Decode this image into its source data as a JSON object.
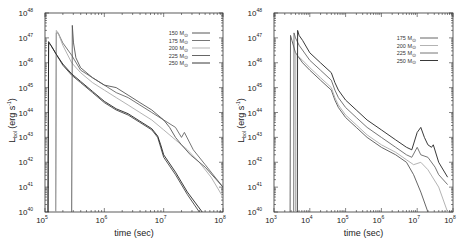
{
  "chart_data": [
    {
      "type": "line",
      "panel": "left",
      "title": "",
      "xlabel": "time (sec)",
      "ylabel": "L_bol (erg s^-1)",
      "ylabel_parts": {
        "main": "L",
        "sub": "bol",
        "rest": " (erg s",
        "sup": "-1",
        "close": ")"
      },
      "xscale": "log",
      "yscale": "log",
      "xlim_exp": [
        5,
        8
      ],
      "ylim_exp": [
        40,
        48
      ],
      "xticks_exp": [
        5,
        6,
        7,
        8
      ],
      "yticks_exp": [
        40,
        41,
        42,
        43,
        44,
        45,
        46,
        47,
        48
      ],
      "tick_base": "10",
      "legend_position": "top-right",
      "series": [
        {
          "name": "150 M⊙",
          "label_num": "150",
          "color": "#444444",
          "log_t": [
            5.05,
            5.06,
            5.1,
            5.2,
            5.3,
            5.45,
            5.6,
            5.8,
            6.0,
            6.2,
            6.4,
            6.6,
            6.8,
            6.9,
            6.95,
            7.0,
            7.2,
            7.4,
            7.6
          ],
          "log_L": [
            40.0,
            46.8,
            46.7,
            46.3,
            45.9,
            45.5,
            45.2,
            44.8,
            44.4,
            44.1,
            43.9,
            43.6,
            43.3,
            43.0,
            42.6,
            42.2,
            41.5,
            40.7,
            40.0
          ]
        },
        {
          "name": "175 M⊙",
          "label_num": "175",
          "color": "#666666",
          "log_t": [
            5.18,
            5.19,
            5.22,
            5.3,
            5.45,
            5.6,
            5.8,
            6.0,
            6.2,
            6.4,
            6.6,
            6.8,
            7.0,
            7.2,
            7.3,
            7.35,
            7.5,
            7.7,
            8.0
          ],
          "log_L": [
            40.0,
            47.2,
            47.2,
            46.8,
            46.3,
            45.7,
            45.4,
            45.1,
            44.8,
            44.6,
            44.3,
            44.0,
            43.7,
            43.4,
            43.0,
            43.2,
            42.5,
            41.9,
            41.0
          ]
        },
        {
          "name": "200 M⊙",
          "label_num": "200",
          "color": "#aaaaaa",
          "log_t": [
            5.18,
            5.19,
            5.22,
            5.3,
            5.45,
            5.6,
            5.8,
            6.0,
            6.2,
            6.4,
            6.6,
            6.8,
            7.0,
            7.2,
            7.4,
            7.6,
            7.8,
            8.0
          ],
          "log_L": [
            40.0,
            47.3,
            47.2,
            46.7,
            46.0,
            45.6,
            45.2,
            44.9,
            44.6,
            44.3,
            44.0,
            43.7,
            43.3,
            42.9,
            42.5,
            42.0,
            41.4,
            40.6
          ]
        },
        {
          "name": "225 M⊙",
          "label_num": "225",
          "color": "#555555",
          "log_t": [
            5.45,
            5.46,
            5.48,
            5.52,
            5.6,
            5.8,
            6.0,
            6.2,
            6.4,
            6.6,
            6.8,
            7.0,
            7.1,
            7.2,
            7.3,
            7.45,
            7.7,
            8.0
          ],
          "log_L": [
            40.0,
            47.5,
            46.8,
            46.2,
            45.8,
            45.4,
            45.1,
            45.0,
            44.7,
            44.4,
            44.1,
            43.7,
            43.4,
            43.0,
            42.7,
            42.3,
            41.8,
            41.0
          ]
        },
        {
          "name": "250 M⊙",
          "label_num": "250",
          "color": "#222222",
          "log_t": [
            5.05,
            5.06,
            5.1,
            5.2,
            5.3,
            5.45,
            5.6,
            5.8,
            6.0,
            6.2,
            6.4,
            6.6,
            6.8,
            6.9,
            6.95,
            7.0,
            7.2,
            7.4,
            7.65
          ],
          "log_L": [
            40.0,
            46.85,
            46.7,
            46.3,
            45.95,
            45.55,
            45.25,
            44.85,
            44.45,
            44.15,
            43.95,
            43.65,
            43.35,
            43.05,
            42.7,
            42.3,
            41.6,
            40.8,
            40.0
          ]
        }
      ]
    },
    {
      "type": "line",
      "panel": "right",
      "title": "",
      "xlabel": "time (sec)",
      "ylabel": "L_bol (erg s^-1)",
      "ylabel_parts": {
        "main": "L",
        "sub": "bol",
        "rest": " (erg s",
        "sup": "-1",
        "close": ")"
      },
      "xscale": "log",
      "yscale": "log",
      "xlim_exp": [
        3,
        8
      ],
      "ylim_exp": [
        40,
        48
      ],
      "xticks_exp": [
        3,
        4,
        5,
        6,
        7,
        8
      ],
      "yticks_exp": [
        40,
        41,
        42,
        43,
        44,
        45,
        46,
        47,
        48
      ],
      "tick_base": "10",
      "legend_position": "top-right",
      "series": [
        {
          "name": "175 M⊙",
          "label_num": "175",
          "color": "#555555",
          "log_t": [
            3.45,
            3.46,
            3.5,
            3.6,
            3.8,
            4.0,
            4.3,
            4.6,
            4.7,
            4.8,
            5.0,
            5.3,
            5.6,
            6.0,
            6.4,
            6.7,
            6.9,
            7.1,
            7.3
          ],
          "log_L": [
            40.0,
            47.1,
            46.9,
            46.4,
            46.0,
            45.7,
            45.3,
            44.9,
            44.5,
            44.2,
            43.8,
            43.4,
            43.0,
            42.6,
            42.3,
            42.0,
            41.5,
            40.8,
            40.0
          ]
        },
        {
          "name": "200 M⊙",
          "label_num": "200",
          "color": "#aaaaaa",
          "log_t": [
            3.6,
            3.61,
            3.65,
            3.8,
            4.0,
            4.3,
            4.6,
            4.7,
            4.8,
            5.0,
            5.3,
            5.6,
            6.0,
            6.4,
            6.7,
            6.9,
            7.1,
            7.3,
            7.6,
            7.85
          ],
          "log_L": [
            40.0,
            46.4,
            46.3,
            46.1,
            45.8,
            45.4,
            45.0,
            44.6,
            44.3,
            43.9,
            43.5,
            43.1,
            42.7,
            42.4,
            42.1,
            41.9,
            42.0,
            41.7,
            41.0,
            40.0
          ]
        },
        {
          "name": "225 M⊙",
          "label_num": "225",
          "color": "#666666",
          "log_t": [
            3.55,
            3.56,
            3.6,
            3.7,
            4.0,
            4.3,
            4.6,
            4.7,
            4.8,
            5.0,
            5.3,
            5.6,
            6.0,
            6.4,
            6.7,
            6.85,
            7.0,
            7.1,
            7.3,
            7.5,
            7.6,
            7.85
          ],
          "log_L": [
            40.0,
            47.2,
            47.0,
            46.7,
            46.1,
            45.7,
            45.3,
            44.9,
            44.6,
            44.2,
            43.8,
            43.4,
            43.0,
            42.6,
            42.3,
            42.2,
            42.6,
            42.3,
            42.2,
            41.8,
            41.5,
            41.1
          ]
        },
        {
          "name": "250 M⊙",
          "label_num": "250",
          "color": "#222222",
          "log_t": [
            3.65,
            3.66,
            3.7,
            3.8,
            4.0,
            4.3,
            4.6,
            4.7,
            4.8,
            5.0,
            5.3,
            5.6,
            6.0,
            6.4,
            6.7,
            6.85,
            7.0,
            7.1,
            7.2,
            7.3,
            7.4,
            7.45,
            7.6,
            7.85
          ],
          "log_L": [
            40.0,
            47.3,
            47.1,
            46.9,
            46.4,
            46.0,
            45.6,
            45.2,
            44.9,
            44.5,
            44.1,
            43.7,
            43.3,
            42.9,
            42.6,
            42.5,
            43.2,
            43.4,
            43.0,
            42.7,
            42.6,
            42.7,
            42.0,
            41.4
          ]
        }
      ]
    }
  ]
}
